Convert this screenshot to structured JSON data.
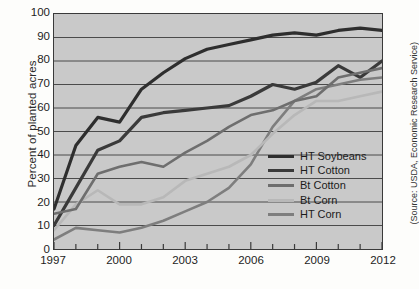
{
  "chart_data": {
    "type": "line",
    "title": "",
    "subtitle": "",
    "xlabel": "",
    "ylabel": "Percent of planted acres",
    "source_note": "(Source: USDA, Economic Research Service)",
    "xlim": [
      1997,
      2012
    ],
    "ylim": [
      0,
      100
    ],
    "grid": true,
    "grid_axis": "y",
    "legend_position": "inside-right-lower",
    "x": [
      1997,
      1998,
      1999,
      2000,
      2001,
      2002,
      2003,
      2004,
      2005,
      2006,
      2007,
      2008,
      2009,
      2010,
      2011,
      2012
    ],
    "xticks": [
      "1997",
      "2000",
      "2003",
      "2006",
      "2009",
      "2012"
    ],
    "xtick_values": [
      1997,
      2000,
      2003,
      2006,
      2009,
      2012
    ],
    "yticks": [
      "0",
      "10",
      "20",
      "30",
      "40",
      "50",
      "60",
      "70",
      "80",
      "90",
      "100"
    ],
    "ytick_values": [
      0,
      10,
      20,
      30,
      40,
      50,
      60,
      70,
      80,
      90,
      100
    ],
    "series": [
      {
        "name": "HT Soybeans",
        "color": "#2e2e2e",
        "width": 3.2,
        "values": [
          17,
          44,
          56,
          54,
          68,
          75,
          81,
          85,
          87,
          89,
          91,
          92,
          91,
          93,
          94,
          93
        ]
      },
      {
        "name": "HT Cotton",
        "color": "#3a3a3a",
        "width": 3.2,
        "values": [
          10,
          26,
          42,
          46,
          56,
          58,
          59,
          60,
          61,
          65,
          70,
          68,
          71,
          78,
          73,
          80
        ]
      },
      {
        "name": "Bt Cotton",
        "color": "#6e6e6e",
        "width": 2.6,
        "values": [
          15,
          17,
          32,
          35,
          37,
          35,
          41,
          46,
          52,
          57,
          59,
          63,
          65,
          73,
          75,
          77
        ]
      },
      {
        "name": "Bt Corn",
        "color": "#b8b8b8",
        "width": 2.6,
        "values": [
          8,
          19,
          25,
          19,
          19,
          22,
          29,
          32,
          35,
          40,
          49,
          57,
          63,
          63,
          65,
          67
        ]
      },
      {
        "name": "HT Corn",
        "color": "#7e7e7e",
        "width": 2.6,
        "values": [
          4,
          9,
          8,
          7,
          9,
          12,
          16,
          20,
          26,
          36,
          52,
          63,
          68,
          70,
          72,
          73
        ]
      }
    ]
  },
  "legend": {
    "items": [
      {
        "label": "HT Soybeans"
      },
      {
        "label": "HT Cotton"
      },
      {
        "label": "Bt Cotton"
      },
      {
        "label": "Bt Corn"
      },
      {
        "label": "HT Corn"
      }
    ]
  },
  "colors": {
    "plot_background": "#c9c9c9",
    "figure_background": "#fdfdfb",
    "axis": "#3a3a3a",
    "grid": "#4a4a4a"
  }
}
